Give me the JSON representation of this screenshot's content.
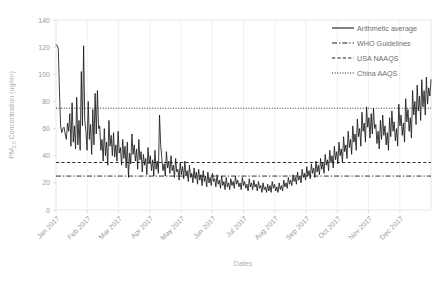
{
  "chart_data": {
    "type": "line",
    "title": "",
    "xlabel": "Dates",
    "ylabel": "PM2.5 Concentration (ug/m³)",
    "ylabel_display": "PM_{2.5} Concentration (ug/m³)",
    "ylim": [
      0,
      140
    ],
    "yticks": [
      0,
      20,
      40,
      60,
      80,
      100,
      120,
      140
    ],
    "ytick_labels": [
      "0",
      "20",
      "40",
      "60",
      "80",
      "100",
      "120",
      "140"
    ],
    "xtick_labels": [
      "Jan 2017",
      "Feb 2017",
      "Mar 2017",
      "Apr 2017",
      "May 2017",
      "Jun 2017",
      "Jul 2017",
      "Aug 2017",
      "Sep 2017",
      "Oct 2017",
      "Nov 2017",
      "Dec 2017"
    ],
    "xlabel_rotation": 45,
    "grid": "vertical-only",
    "legend_position": "top-right",
    "legend": [
      {
        "label": "Arithmetic average",
        "style": "solid"
      },
      {
        "label": "WHO Guidelines",
        "style": "dashdot"
      },
      {
        "label": "USA NAAQS",
        "style": "dashed"
      },
      {
        "label": "China AAQS",
        "style": "dotted"
      }
    ],
    "reference_lines": [
      {
        "name": "China AAQS",
        "value": 75,
        "style": "dotted"
      },
      {
        "name": "USA NAAQS",
        "value": 35,
        "style": "dashed"
      },
      {
        "name": "WHO Guidelines",
        "value": 25,
        "style": "dashdot"
      }
    ],
    "series": [
      {
        "name": "Arithmetic average",
        "style": "solid",
        "values": [
          122,
          121,
          119,
          88,
          62,
          57,
          60,
          61,
          56,
          52,
          64,
          58,
          71,
          47,
          79,
          50,
          62,
          45,
          83,
          48,
          66,
          44,
          102,
          62,
          121,
          66,
          58,
          44,
          80,
          52,
          63,
          41,
          74,
          48,
          86,
          56,
          88,
          60,
          62,
          44,
          52,
          36,
          60,
          40,
          50,
          33,
          66,
          47,
          55,
          40,
          57,
          39,
          48,
          36,
          58,
          42,
          46,
          33,
          52,
          38,
          47,
          31,
          50,
          24,
          42,
          34,
          56,
          41,
          48,
          36,
          45,
          30,
          52,
          37,
          43,
          28,
          41,
          33,
          38,
          26,
          46,
          34,
          40,
          29,
          37,
          25,
          44,
          30,
          36,
          27,
          70,
          48,
          38,
          29,
          34,
          25,
          43,
          31,
          36,
          27,
          40,
          29,
          33,
          24,
          38,
          28,
          30,
          22,
          35,
          26,
          32,
          23,
          36,
          25,
          29,
          21,
          33,
          24,
          27,
          20,
          31,
          23,
          28,
          19,
          30,
          22,
          26,
          18,
          29,
          21,
          25,
          17,
          28,
          20,
          24,
          18,
          27,
          21,
          23,
          17,
          26,
          19,
          22,
          16,
          25,
          18,
          21,
          15,
          24,
          17,
          20,
          15,
          23,
          18,
          21,
          16,
          25,
          19,
          22,
          17,
          20,
          15,
          24,
          18,
          21,
          16,
          19,
          14,
          23,
          17,
          20,
          15,
          22,
          17,
          19,
          14,
          21,
          16,
          18,
          13,
          20,
          15,
          17,
          13,
          19,
          14,
          18,
          13,
          21,
          16,
          19,
          14,
          17,
          13,
          20,
          15,
          18,
          14,
          22,
          17,
          20,
          16,
          24,
          19,
          22,
          18,
          26,
          21,
          24,
          19,
          28,
          22,
          25,
          20,
          30,
          24,
          27,
          22,
          32,
          25,
          29,
          23,
          34,
          27,
          31,
          24,
          36,
          28,
          33,
          26,
          38,
          30,
          35,
          27,
          41,
          33,
          37,
          29,
          44,
          35,
          40,
          31,
          47,
          37,
          43,
          34,
          50,
          40,
          45,
          35,
          54,
          43,
          48,
          38,
          58,
          46,
          52,
          41,
          62,
          50,
          56,
          44,
          67,
          54,
          60,
          47,
          72,
          58,
          64,
          50,
          76,
          61,
          68,
          53,
          71,
          56,
          75,
          60,
          63,
          49,
          58,
          45,
          66,
          52,
          70,
          55,
          62,
          48,
          57,
          44,
          68,
          54,
          73,
          58,
          65,
          51,
          60,
          47,
          78,
          62,
          70,
          55,
          64,
          50,
          82,
          65,
          74,
          58,
          68,
          53,
          88,
          70,
          80,
          63,
          92,
          73,
          84,
          66,
          96,
          76,
          88,
          70,
          98,
          78,
          90,
          84,
          96
        ]
      }
    ]
  },
  "axis": {
    "y_title": "PM",
    "y_title_sub": "2.5",
    "y_title_rest": " Concentration (ug/m³)",
    "x_title": "Dates"
  }
}
